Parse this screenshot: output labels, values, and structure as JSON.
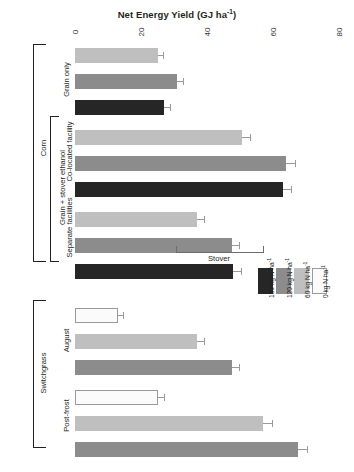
{
  "chart_data": {
    "type": "bar",
    "orientation": "horizontal-rotated",
    "title": "Net Energy Yield (GJ ha-1)",
    "xlabel": "Net Energy Yield (GJ ha-1)",
    "ylabel": "",
    "xlim": [
      0,
      80
    ],
    "xticks": [
      0,
      20,
      40,
      60,
      80
    ],
    "grid": false,
    "stacked": true,
    "stack_components": [
      "Grain",
      "Stover"
    ],
    "annotation": "Stover",
    "legend_position": "right-middle",
    "legend": [
      {
        "label": "180 kg N ha-1",
        "color": "#262626"
      },
      {
        "label": "120 kg N ha-1",
        "color": "#8c8c8c"
      },
      {
        "label": "60 kg N ha-1",
        "color": "#bfbfbf"
      },
      {
        "label": "0 kg N ha-1",
        "color": "#fbfbfb"
      }
    ],
    "groups": [
      {
        "name": "Corn",
        "subgroups": [
          {
            "name": "Grain only",
            "parent": "",
            "bars": [
              {
                "rate": "60 kg N ha-1",
                "color": "#bfbfbf",
                "grain": 25.0,
                "stover": 0,
                "total": 25.0,
                "error": 1.6
              },
              {
                "rate": "120 kg N ha-1",
                "color": "#8c8c8c",
                "grain": 31.0,
                "stover": 0,
                "total": 31.0,
                "error": 1.8
              },
              {
                "rate": "180 kg N ha-1",
                "color": "#262626",
                "grain": 27.0,
                "stover": 0,
                "total": 27.0,
                "error": 1.7
              }
            ]
          },
          {
            "name": "Co-located facility",
            "parent": "Grain + stover ethanol",
            "bars": [
              {
                "rate": "60 kg N ha-1",
                "color": "#bfbfbf",
                "grain": 41.0,
                "stover": 9.5,
                "total": 50.5,
                "error": 2.4
              },
              {
                "rate": "120 kg N ha-1",
                "color": "#8c8c8c",
                "grain": 53.0,
                "stover": 11.0,
                "total": 64.0,
                "error": 2.8
              },
              {
                "rate": "180 kg N ha-1",
                "color": "#262626",
                "grain": 54.0,
                "stover": 9.0,
                "total": 63.0,
                "error": 2.6
              }
            ]
          },
          {
            "name": "Separate facilities",
            "parent": "Grain + stover ethanol",
            "bars": [
              {
                "rate": "60 kg N ha-1",
                "color": "#bfbfbf",
                "grain": 24.5,
                "stover": 12.5,
                "total": 37.0,
                "error": 2.0
              },
              {
                "rate": "120 kg N ha-1",
                "color": "#8c8c8c",
                "grain": 31.5,
                "stover": 16.0,
                "total": 47.5,
                "error": 2.3
              },
              {
                "rate": "180 kg N ha-1",
                "color": "#262626",
                "grain": 30.5,
                "stover": 17.5,
                "total": 48.0,
                "error": 2.3
              }
            ]
          }
        ]
      },
      {
        "name": "Switchgrass",
        "subgroups": [
          {
            "name": "August",
            "parent": "",
            "bars": [
              {
                "rate": "0 kg N ha-1",
                "color": "#fbfbfb",
                "grain": 13.0,
                "stover": 0,
                "total": 13.0,
                "error": 1.4
              },
              {
                "rate": "60 kg N ha-1",
                "color": "#bfbfbf",
                "grain": 37.0,
                "stover": 0,
                "total": 37.0,
                "error": 2.0
              },
              {
                "rate": "120 kg N ha-1",
                "color": "#8c8c8c",
                "grain": 47.5,
                "stover": 0,
                "total": 47.5,
                "error": 2.2
              }
            ]
          },
          {
            "name": "Post-frost",
            "parent": "",
            "bars": [
              {
                "rate": "0 kg N ha-1",
                "color": "#fbfbfb",
                "grain": 25.0,
                "stover": 0,
                "total": 25.0,
                "error": 1.9
              },
              {
                "rate": "60 kg N ha-1",
                "color": "#bfbfbf",
                "grain": 57.0,
                "stover": 0,
                "total": 57.0,
                "error": 2.6
              },
              {
                "rate": "120 kg N ha-1",
                "color": "#8c8c8c",
                "grain": 67.5,
                "stover": 0,
                "total": 67.5,
                "error": 2.8
              }
            ]
          }
        ]
      }
    ]
  },
  "axis": {
    "title_main": "Net Energy Yield (GJ ha",
    "title_sup": "-1",
    "title_tail": ")",
    "ticks": [
      "0",
      "20",
      "40",
      "60",
      "80"
    ]
  },
  "labels": {
    "corn": "Corn",
    "grain_only": "Grain only",
    "grain_stover": "Grain + stover ethanol",
    "co_located": "Co-located facility",
    "separate": "Separate facilities",
    "switchgrass": "Switchgrass",
    "august": "August",
    "post_frost": "Post-frost",
    "stover": "Stover"
  },
  "legend": {
    "items": [
      {
        "label_main": "180 kg N ha",
        "label_sup": "-1"
      },
      {
        "label_main": "120 kg N ha",
        "label_sup": "-1"
      },
      {
        "label_main": "60 kg N ha",
        "label_sup": "-1"
      },
      {
        "label_main": "0 kg N ha",
        "label_sup": "-1"
      }
    ]
  }
}
